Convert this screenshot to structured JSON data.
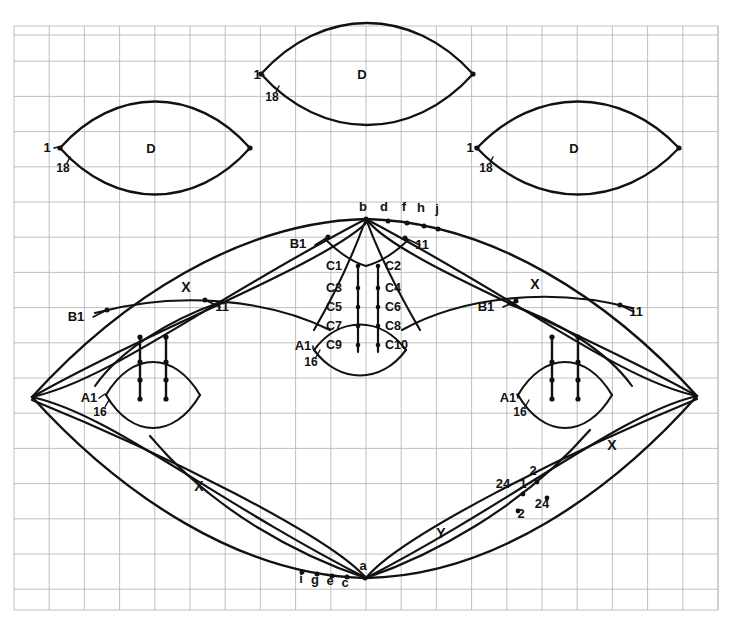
{
  "figure": {
    "background_color": "#ffffff",
    "grid_color": "#b9b9b9",
    "stroke_color": "#111111",
    "grid": {
      "x0": 14,
      "y0": 26,
      "x1": 718,
      "y1": 610,
      "cell": 35.2,
      "cols": 20,
      "rows": 16.6
    }
  },
  "top_lenses": [
    {
      "name": "lens-top-center",
      "label": "D",
      "left_label": "1",
      "arc_label": "18",
      "cx": 367,
      "cy": 74,
      "half_width": 106,
      "half_height": 34,
      "label_x": 362,
      "label_y": 79,
      "num_x": 257,
      "num_y": 79,
      "arc_x": 272,
      "arc_y": 101
    },
    {
      "name": "lens-top-left",
      "label": "D",
      "left_label": "1",
      "arc_label": "18",
      "cx": 155,
      "cy": 148,
      "half_width": 95,
      "half_height": 31,
      "label_x": 151,
      "label_y": 153,
      "num_x": 47,
      "num_y": 152,
      "arc_x": 63,
      "arc_y": 172
    },
    {
      "name": "lens-top-right",
      "label": "D",
      "left_label": "1",
      "arc_label": "18",
      "cx": 578,
      "cy": 148,
      "half_width": 101,
      "half_height": 31,
      "label_x": 574,
      "label_y": 153,
      "num_x": 470,
      "num_y": 152,
      "arc_x": 486,
      "arc_y": 172
    }
  ],
  "small_lenses": [
    {
      "name": "lens-small-left",
      "left_label": "A1",
      "sub_label": "16",
      "cx": 153,
      "cy": 395,
      "half_width": 47,
      "half_height": 22,
      "num_x": 89,
      "num_y": 402,
      "arc_x": 100,
      "arc_y": 416
    },
    {
      "name": "lens-small-right",
      "left_label": "A1",
      "sub_label": "16",
      "cx": 565,
      "cy": 395,
      "half_width": 47,
      "half_height": 22,
      "num_x": 508,
      "num_y": 402,
      "arc_x": 520,
      "arc_y": 416
    },
    {
      "name": "lens-small-center",
      "left_label": "A1",
      "sub_label": "16",
      "cx": 360,
      "cy": 350,
      "half_width": 46,
      "half_height": 17,
      "num_x": 303,
      "num_y": 350,
      "arc_x": 311,
      "arc_y": 366
    }
  ],
  "center_labels": {
    "pairs": [
      {
        "left": "C1",
        "right": "C2",
        "y": 270
      },
      {
        "left": "C3",
        "right": "C4",
        "y": 292
      },
      {
        "left": "C5",
        "right": "C6",
        "y": 311
      },
      {
        "left": "C7",
        "right": "C8",
        "y": 330
      },
      {
        "left": "C9",
        "right": "C10",
        "y": 349
      }
    ],
    "left_x": 334,
    "right_x": 377,
    "left_rail_x": 358,
    "right_rail_x": 378
  },
  "top_point_labels": [
    {
      "text": "b",
      "x": 363,
      "y": 211,
      "px": 366,
      "py": 219
    },
    {
      "text": "d",
      "x": 384,
      "y": 211,
      "px": 388,
      "py": 221
    },
    {
      "text": "f",
      "x": 404,
      "y": 211,
      "px": 407,
      "py": 223
    },
    {
      "text": "h",
      "x": 421,
      "y": 212,
      "px": 424,
      "py": 226
    },
    {
      "text": "j",
      "x": 437,
      "y": 213,
      "px": 438,
      "py": 229
    }
  ],
  "bottom_point_labels": [
    {
      "text": "i",
      "x": 301,
      "y": 583,
      "px": 302,
      "py": 572
    },
    {
      "text": "g",
      "x": 315,
      "y": 584,
      "px": 317,
      "py": 574
    },
    {
      "text": "e",
      "x": 330,
      "y": 585,
      "px": 332,
      "py": 576
    },
    {
      "text": "c",
      "x": 345,
      "y": 587,
      "px": 347,
      "py": 577
    },
    {
      "text": "a",
      "x": 363,
      "y": 570,
      "px": 365,
      "py": 578
    }
  ],
  "leader_labels": [
    {
      "name": "leader-b1-center",
      "text": "B1",
      "tx": 298,
      "ty": 248,
      "lx1": 315,
      "ly1": 245,
      "lx2": 328,
      "ly2": 237
    },
    {
      "name": "leader-11-center",
      "text": "11",
      "tx": 422,
      "ty": 249,
      "lx1": 420,
      "ly1": 245,
      "lx2": 405,
      "ly2": 238
    },
    {
      "name": "leader-b1-left",
      "text": "B1",
      "tx": 76,
      "ty": 321,
      "lx1": 93,
      "ly1": 317,
      "lx2": 107,
      "ly2": 310
    },
    {
      "name": "leader-11-left",
      "text": "11",
      "tx": 222,
      "ty": 311,
      "lx1": 220,
      "ly1": 307,
      "lx2": 205,
      "ly2": 300
    },
    {
      "name": "leader-b1-right",
      "text": "B1",
      "tx": 486,
      "ty": 311,
      "lx1": 503,
      "ly1": 307,
      "lx2": 516,
      "ly2": 301
    },
    {
      "name": "leader-11-right",
      "text": "11",
      "tx": 636,
      "ty": 316,
      "lx1": 634,
      "ly1": 312,
      "lx2": 620,
      "ly2": 305
    }
  ],
  "curve_labels": [
    {
      "name": "label-x-upper-left",
      "text": "X",
      "x": 186,
      "y": 292
    },
    {
      "name": "label-x-upper-right",
      "text": "X",
      "x": 535,
      "y": 289
    },
    {
      "name": "label-x-lower-left",
      "text": "X",
      "x": 199,
      "y": 491
    },
    {
      "name": "label-x-lower-right",
      "text": "X",
      "x": 612,
      "y": 450
    },
    {
      "name": "label-y-bottom",
      "text": "Y",
      "x": 441,
      "y": 538
    }
  ],
  "crossing_labels": [
    {
      "name": "crossing-24-left",
      "text": "24",
      "x": 503,
      "y": 488,
      "px": 523,
      "py": 494
    },
    {
      "name": "crossing-1",
      "text": "1",
      "x": 523,
      "y": 488
    },
    {
      "name": "crossing-2-upper",
      "text": "2",
      "x": 533,
      "y": 475,
      "px": 537,
      "py": 482
    },
    {
      "name": "crossing-2-lower",
      "text": "2",
      "x": 521,
      "y": 518,
      "px": 518,
      "py": 511
    },
    {
      "name": "crossing-24-right",
      "text": "24",
      "x": 542,
      "y": 508,
      "px": 547,
      "py": 498
    }
  ],
  "main_figure": {
    "left_vertex": {
      "x": 32,
      "y": 397
    },
    "right_vertex": {
      "x": 697,
      "y": 396
    },
    "top_vertex": {
      "x": 366,
      "y": 219
    },
    "bottom_vertex": {
      "x": 366,
      "y": 578
    }
  }
}
